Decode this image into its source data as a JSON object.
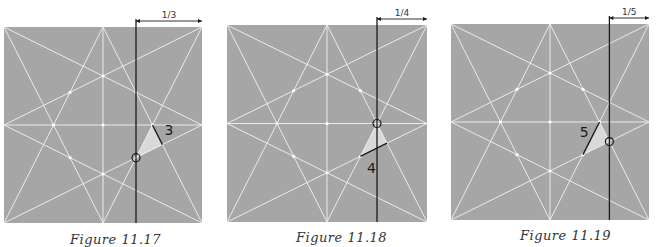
{
  "colors": {
    "paper": "#a6a6a6",
    "crease": "#f2f2f2",
    "ink": "#1a1a1a",
    "highlight": "#d9d9d9"
  },
  "figures": [
    {
      "id": "fig-11-17",
      "caption": "Figure 11.17",
      "dimension_label": "1/3",
      "step_label": "3",
      "box": {
        "x": 4,
        "y": 27,
        "w": 198,
        "h": 196
      },
      "vertical_line_x": 133.333,
      "circle": [
        133.333,
        133.333
      ],
      "triangle": [
        [
          133.333,
          133.333
        ],
        [
          150,
          100
        ],
        [
          160,
          120
        ]
      ],
      "ink_segment": [
        [
          150,
          100
        ],
        [
          160,
          120
        ]
      ],
      "step_label_pos": [
        162,
        110
      ],
      "caption_pos": {
        "x": 70,
        "y": 232
      }
    },
    {
      "id": "fig-11-18",
      "caption": "Figure 11.18",
      "dimension_label": "1/4",
      "step_label": "4",
      "box": {
        "x": 227,
        "y": 25,
        "w": 200,
        "h": 197
      },
      "vertical_line_x": 150,
      "circle": [
        150,
        100
      ],
      "triangle": [
        [
          150,
          100
        ],
        [
          133.333,
          133.333
        ],
        [
          160,
          120
        ]
      ],
      "ink_segment": [
        [
          133.333,
          133.333
        ],
        [
          160,
          120
        ]
      ],
      "step_label_pos": [
        140,
        150
      ],
      "caption_pos": {
        "x": 296,
        "y": 230
      }
    },
    {
      "id": "fig-11-19",
      "caption": "Figure 11.19",
      "dimension_label": "1/5",
      "step_label": "5",
      "box": {
        "x": 451,
        "y": 24,
        "w": 198,
        "h": 196
      },
      "vertical_line_x": 160,
      "circle": [
        160,
        120
      ],
      "triangle": [
        [
          160,
          120
        ],
        [
          150,
          100
        ],
        [
          133.333,
          133.333
        ]
      ],
      "ink_segment": [
        [
          150,
          100
        ],
        [
          133.333,
          133.333
        ]
      ],
      "step_label_pos": [
        130,
        115
      ],
      "caption_pos": {
        "x": 520,
        "y": 228
      }
    }
  ],
  "crease_pattern": {
    "viewbox": 200,
    "lines": [
      [
        [
          0,
          0
        ],
        [
          100,
          200
        ]
      ],
      [
        [
          0,
          0
        ],
        [
          200,
          100
        ]
      ],
      [
        [
          200,
          0
        ],
        [
          100,
          200
        ]
      ],
      [
        [
          200,
          0
        ],
        [
          0,
          100
        ]
      ],
      [
        [
          0,
          200
        ],
        [
          100,
          0
        ]
      ],
      [
        [
          0,
          200
        ],
        [
          200,
          100
        ]
      ],
      [
        [
          200,
          200
        ],
        [
          100,
          0
        ]
      ],
      [
        [
          200,
          200
        ],
        [
          0,
          100
        ]
      ],
      [
        [
          100,
          0
        ],
        [
          100,
          200
        ]
      ],
      [
        [
          0,
          100
        ],
        [
          200,
          100
        ]
      ]
    ],
    "dots": [
      [
        100,
        100
      ],
      [
        100,
        50
      ],
      [
        100,
        150
      ],
      [
        50,
        100
      ],
      [
        150,
        100
      ],
      [
        66.667,
        66.667
      ],
      [
        133.333,
        66.667
      ],
      [
        66.667,
        133.333
      ],
      [
        133.333,
        133.333
      ]
    ]
  }
}
